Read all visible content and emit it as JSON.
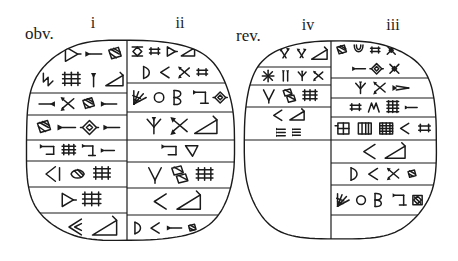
{
  "figure": {
    "type": "cuneiform-tablet-hand-copy",
    "background": "#ffffff",
    "ink": "#1b1b1b",
    "labels": {
      "obverse": "obv.",
      "reverse": "rev.",
      "col_i": "i",
      "col_ii": "ii",
      "col_iv": "iv",
      "col_iii": "iii"
    },
    "tablets": [
      {
        "name": "obverse",
        "shape": {
          "cx": 130,
          "cy": 141,
          "rx": 104,
          "ry": 100,
          "n": 3
        },
        "divider_x": 127,
        "columns": [
          {
            "name": "i",
            "side": "left",
            "cases": [
              {
                "y0": 41,
                "y1": 93,
                "rows": [
                  [
                    "tri_r@1.25",
                    "wedge_r@1.1",
                    "hatchbox@1.15"
                  ],
                  [
                    "hook@1.0",
                    "grid@1.15",
                    "wedge_up@0.9",
                    "wedge_big@1.0"
                  ]
                ]
              },
              {
                "y0": 93,
                "y1": 115,
                "rows": [
                  [
                    "wedge_l@1.0",
                    "chevX@1.0",
                    "hatchbox@1.0",
                    "wedge_r@1.0"
                  ]
                ]
              },
              {
                "y0": 115,
                "y1": 140,
                "rows": [
                  [
                    "hatchbox@1.0",
                    "wedge_r@1.0",
                    "diamond_w@1.0",
                    "wedge_r@0.9"
                  ]
                ]
              },
              {
                "y0": 140,
                "y1": 161,
                "rows": [
                  [
                    "bracket_w@1.1",
                    "grid@1.0",
                    "corner_w@1.0",
                    "wedge_r@0.9"
                  ]
                ]
              },
              {
                "y0": 161,
                "y1": 187,
                "rows": [
                  [
                    "winkel_b@1.0",
                    "hatch_oval@1.05",
                    "grid@1.0"
                  ]
                ]
              },
              {
                "y0": 187,
                "y1": 213,
                "rows": [
                  [
                    "tri_r@0.9",
                    "grid@1.1"
                  ]
                ]
              },
              {
                "y0": 213,
                "y1": 241,
                "rows": [
                  [
                    "winkel2@1.0",
                    "wedge_big@1.2"
                  ]
                ]
              }
            ]
          },
          {
            "name": "ii",
            "side": "right",
            "cases": [
              {
                "y0": 41,
                "y1": 83,
                "rows": [
                  [
                    "diafence@1.0",
                    "grid_s@1.0",
                    "tri_r@0.9",
                    "wedge_big@1.0"
                  ],
                  [
                    "dshape@1.0",
                    "winkel@0.9",
                    "chevX@0.9",
                    "grid_s@0.9"
                  ]
                ]
              },
              {
                "y0": 83,
                "y1": 112,
                "rows": [
                  [
                    "fanhatch@1.15",
                    "circle@0.95",
                    "bshape@1.2",
                    "corner_w@1.15",
                    "diamond_w@0.95"
                  ]
                ]
              },
              {
                "y0": 112,
                "y1": 140,
                "rows": [
                  [
                    "tripod@1.0",
                    "chevX@1.0",
                    "wedge_big@1.1"
                  ]
                ]
              },
              {
                "y0": 140,
                "y1": 162,
                "rows": [
                  [
                    "bracket_w@1.1",
                    "tri_dn@1.0"
                  ]
                ]
              },
              {
                "y0": 162,
                "y1": 188,
                "rows": [
                  [
                    "winkel_v@1.0",
                    "hatch2@1.1",
                    "grid@1.0"
                  ]
                ]
              },
              {
                "y0": 188,
                "y1": 215,
                "rows": [
                  [
                    "winkel@1.0",
                    "wedge_big@1.2"
                  ]
                ]
              },
              {
                "y0": 215,
                "y1": 241,
                "rows": [
                  [
                    "dshape@1.0",
                    "winkel@0.9",
                    "wedge_r@1.0",
                    "hatch_sm@0.9"
                  ]
                ]
              }
            ]
          }
        ]
      },
      {
        "name": "reverse",
        "shape": {
          "cx": 340,
          "cy": 140,
          "rx": 96,
          "ry": 99,
          "n": 3
        },
        "divider_x": 331,
        "columns": [
          {
            "name": "iv",
            "side": "left",
            "cases": [
              {
                "y0": 41,
                "y1": 67,
                "rows": [
                  [
                    "chev_cluster@1.0",
                    "chev_cluster@0.9",
                    "wedge_big@1.1"
                  ]
                ]
              },
              {
                "y0": 67,
                "y1": 85,
                "rows": [
                  [
                    "star@1.0",
                    "vbars@1.0",
                    "tripod@0.9",
                    "chevX@0.9"
                  ]
                ]
              },
              {
                "y0": 85,
                "y1": 107,
                "rows": [
                  [
                    "winkel_v@1.0",
                    "hatch2@1.0",
                    "grid@1.0"
                  ]
                ]
              },
              {
                "y0": 107,
                "y1": 140,
                "rows": [
                  [
                    "winkel@1.1",
                    "wedge_big@1.2"
                  ],
                  [
                    "hlines3@1.0",
                    "hlines3@0.9"
                  ]
                ]
              }
            ]
          },
          {
            "name": "iii",
            "side": "right",
            "cases": [
              {
                "y0": 41,
                "y1": 78,
                "rows": [
                  [
                    "hatchbox@1.1",
                    "ushape@1.1",
                    "grid_s@1.0",
                    "xwedge@1.0"
                  ],
                  [
                    "wedge_r@1.0",
                    "diamond_w@1.0",
                    "xwedge@1.0"
                  ]
                ]
              },
              {
                "y0": 78,
                "y1": 98,
                "rows": [
                  [
                    "tripod@1.0",
                    "chevX@1.0",
                    "wedge_long@1.2"
                  ]
                ]
              },
              {
                "y0": 98,
                "y1": 117,
                "rows": [
                  [
                    "grid_s@1.0",
                    "mwedge@1.0",
                    "bgrid@1.1",
                    "wedge_r@0.9"
                  ]
                ]
              },
              {
                "y0": 117,
                "y1": 140,
                "rows": [
                  [
                    "plusgrid@1.0",
                    "boxgrid@1.0",
                    "boxfill@1.0",
                    "winkel@0.8",
                    "grid_s@0.9"
                  ]
                ]
              },
              {
                "y0": 140,
                "y1": 163,
                "rows": [
                  [
                    "winkel@1.1",
                    "wedge_big@1.2"
                  ]
                ]
              },
              {
                "y0": 163,
                "y1": 185,
                "rows": [
                  [
                    "dshape@1.0",
                    "winkel@0.9",
                    "chevX@0.9",
                    "hatch_sm@0.9"
                  ]
                ]
              },
              {
                "y0": 185,
                "y1": 215,
                "rows": [
                  [
                    "fanhatch@1.15",
                    "circle@0.95",
                    "bshape@1.2",
                    "corner_w@1.1",
                    "boxdia@1.0"
                  ]
                ]
              }
            ]
          }
        ]
      }
    ]
  }
}
